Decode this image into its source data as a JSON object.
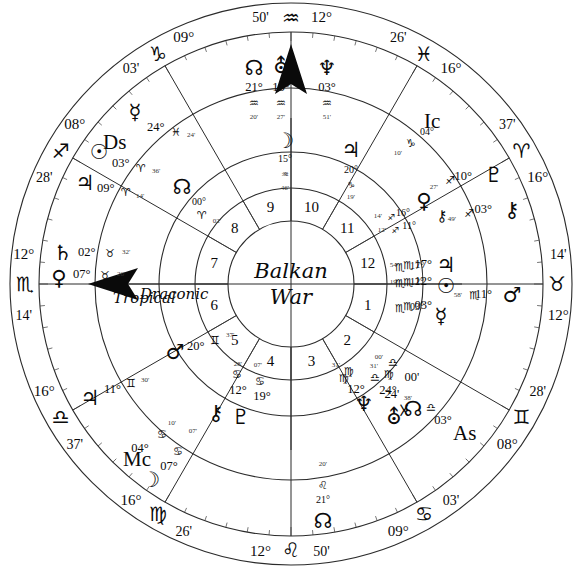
{
  "chart": {
    "title_line1": "Balkan",
    "title_line2": "War",
    "ring_label_outer": "Tropical",
    "ring_label_inner": "Draconic",
    "angles": {
      "ascendant": "As",
      "descendant": "Ds",
      "midheaven": "Mc",
      "imum_coeli": "Ic"
    },
    "house_numbers": [
      "1",
      "2",
      "3",
      "4",
      "5",
      "6",
      "7",
      "8",
      "9",
      "10",
      "11",
      "12"
    ],
    "cusps": [
      {
        "house": "1",
        "deg": "12°",
        "sign": "♉",
        "min": "14'",
        "pos_deg": 180
      },
      {
        "house": "2",
        "deg": "08°",
        "sign": "♊",
        "min": "28'",
        "pos_deg": 210
      },
      {
        "house": "3",
        "deg": "09°",
        "sign": "♋",
        "min": "03'",
        "pos_deg": 240
      },
      {
        "house": "4",
        "deg": "12°",
        "sign": "♌",
        "min": "50'",
        "pos_deg": 270
      },
      {
        "house": "5",
        "deg": "16°",
        "sign": "♍",
        "min": "26'",
        "pos_deg": 300
      },
      {
        "house": "6",
        "deg": "16°",
        "sign": "♎",
        "min": "37'",
        "pos_deg": 330
      },
      {
        "house": "7",
        "deg": "12°",
        "sign": "♏",
        "min": "14'",
        "pos_deg": 0
      },
      {
        "house": "8",
        "deg": "08°",
        "sign": "♐",
        "min": "28'",
        "pos_deg": 30
      },
      {
        "house": "9",
        "deg": "09°",
        "sign": "♑",
        "min": "03'",
        "pos_deg": 60
      },
      {
        "house": "10",
        "deg": "12°",
        "sign": "♒",
        "min": "50'",
        "pos_deg": 90
      },
      {
        "house": "11",
        "deg": "16°",
        "sign": "♓",
        "min": "26'",
        "pos_deg": 120
      },
      {
        "house": "12",
        "deg": "16°",
        "sign": "♈",
        "min": "37'",
        "pos_deg": 150
      }
    ],
    "planets_outer": [
      {
        "name": "north-node",
        "glyph": "☊",
        "deg": "21°",
        "sign": "♒",
        "min": "20'"
      },
      {
        "name": "uranus",
        "glyph": "⛢",
        "deg": "15°",
        "sign": "♒",
        "min": "27'"
      },
      {
        "name": "neptune",
        "glyph": "♆",
        "deg": "03°",
        "sign": "♒",
        "min": "51'"
      },
      {
        "name": "pluto",
        "glyph": "♇",
        "deg": "10°",
        "sign": "♐",
        "min": "27'"
      },
      {
        "name": "chiron",
        "glyph": "⚷",
        "deg": "03°",
        "sign": "♐",
        "min": "49'"
      },
      {
        "name": "mars",
        "glyph": "♂",
        "deg": "11°",
        "sign": "♏",
        "min": "58'"
      },
      {
        "name": "jupiter",
        "glyph": "♃",
        "deg": "17°",
        "sign": "♏",
        "min": "54'"
      },
      {
        "name": "sun",
        "glyph": "☉",
        "deg": "12°",
        "sign": "♏",
        "min": "19'"
      },
      {
        "name": "mercury",
        "glyph": "☿",
        "deg": "03°",
        "sign": "♏",
        "min": ""
      },
      {
        "name": "south-node",
        "glyph": "☓",
        "deg": "00°",
        "sign": "♎",
        "min": "24'"
      },
      {
        "name": "venus-outer",
        "glyph": "♀",
        "deg": "12°",
        "sign": "♍",
        "min": "31'"
      },
      {
        "name": "saturn",
        "glyph": "♄",
        "deg": "02°",
        "sign": "♉",
        "min": "32'"
      },
      {
        "name": "venus",
        "glyph": "♀",
        "deg": "07°",
        "sign": "♉",
        "min": "26'"
      },
      {
        "name": "moon-lower",
        "glyph": "☽",
        "deg": "07°",
        "sign": "♋",
        "min": "07'"
      },
      {
        "name": "jupiter-lo",
        "glyph": "♃",
        "deg": "11°",
        "sign": "♊",
        "min": "30'"
      }
    ],
    "planets_inner": [
      {
        "name": "moon",
        "glyph": "☽",
        "deg": "15°",
        "sign": "♒",
        "min": "46'"
      },
      {
        "name": "jupiter-inner",
        "glyph": "♃",
        "deg": "20°",
        "sign": "♑",
        "min": "19'"
      },
      {
        "name": "ic-capricorn",
        "glyph": "♑",
        "deg": "04°",
        "sign": "",
        "min": "10'"
      },
      {
        "name": "venus-inner",
        "glyph": "♀",
        "deg": "16°",
        "sign": "♐",
        "min": "14'"
      },
      {
        "name": "chiron-inner",
        "glyph": "⚷",
        "deg": "11°",
        "sign": "♐",
        "min": "12'"
      },
      {
        "name": "jupiter-sco",
        "glyph": "",
        "deg": "17°",
        "sign": "♏",
        "min": ""
      },
      {
        "name": "sun-sco",
        "glyph": "",
        "deg": "12°",
        "sign": "♏",
        "min": ""
      },
      {
        "name": "mercury-sco",
        "glyph": "☿",
        "deg": "03°",
        "sign": "♏",
        "min": ""
      },
      {
        "name": "virgo-inner",
        "glyph": "♍",
        "deg": "12°",
        "sign": "",
        "min": "31'"
      },
      {
        "name": "virgo-libra",
        "glyph": "♎",
        "deg": "24°",
        "sign": "♍",
        "min": "00'"
      },
      {
        "name": "libra-as",
        "glyph": "♎",
        "deg": "03°",
        "sign": "",
        "min": "38'"
      },
      {
        "name": "leo-node",
        "glyph": "♌",
        "deg": "21°",
        "sign": "",
        "min": "20'"
      },
      {
        "name": "cancer-1",
        "glyph": "♋",
        "deg": "12°",
        "sign": "",
        "min": "28'"
      },
      {
        "name": "cancer-2",
        "glyph": "♋",
        "deg": "19°",
        "sign": "",
        "min": "07'"
      },
      {
        "name": "cancer-3",
        "glyph": "♋",
        "deg": "04°",
        "sign": "",
        "min": "10'"
      },
      {
        "name": "cancer-4",
        "glyph": "♋",
        "deg": "07°",
        "sign": "",
        "min": "07'"
      },
      {
        "name": "gemini-mars",
        "glyph": "♊",
        "deg": "20°",
        "sign": "",
        "min": "37'"
      },
      {
        "name": "gemini-jup",
        "glyph": "♊",
        "deg": "11°",
        "sign": "",
        "min": "30'"
      },
      {
        "name": "aries-node",
        "glyph": "♈",
        "deg": "00°",
        "sign": "",
        "min": "02'"
      },
      {
        "name": "aries-sun",
        "glyph": "♈",
        "deg": "03°",
        "sign": "",
        "min": "36'"
      },
      {
        "name": "aries-ds",
        "glyph": "♈",
        "deg": "03°",
        "sign": "",
        "min": "38'"
      },
      {
        "name": "aries-jup",
        "glyph": "♈",
        "deg": "09°",
        "sign": "",
        "min": "14'"
      },
      {
        "name": "pisces-merc",
        "glyph": "♓",
        "deg": "24°",
        "sign": "",
        "min": "24'"
      },
      {
        "name": "taurus-sat",
        "glyph": "♉",
        "deg": "02°",
        "sign": "",
        "min": "32'"
      },
      {
        "name": "taurus-ven",
        "glyph": "♉",
        "deg": "07°",
        "sign": "",
        "min": "26'"
      }
    ],
    "colors": {
      "ink": "#0a0a0a",
      "line": "#2b2b2b",
      "background": "#ffffff"
    }
  }
}
